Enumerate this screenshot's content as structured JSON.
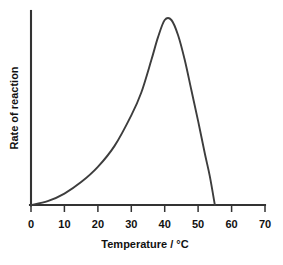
{
  "chart_data": {
    "type": "line",
    "title": "",
    "xlabel": "Temperature / °C",
    "ylabel": "Rate of reaction",
    "xlim": [
      0,
      70
    ],
    "ylim": [
      0,
      1.05
    ],
    "grid": false,
    "legend": "none",
    "x_ticks": [
      "0",
      "10",
      "20",
      "30",
      "40",
      "50",
      "60",
      "70"
    ],
    "x_tick_values": [
      0,
      10,
      20,
      30,
      40,
      50,
      60,
      70
    ],
    "y_ticks": [],
    "series": [
      {
        "name": "Rate of reaction",
        "x": [
          0,
          5,
          10,
          15,
          20,
          25,
          30,
          33,
          36,
          38,
          40,
          42,
          44,
          46,
          48,
          50,
          52,
          53.5,
          55
        ],
        "y": [
          0.0,
          0.02,
          0.06,
          0.12,
          0.2,
          0.31,
          0.47,
          0.59,
          0.76,
          0.88,
          0.97,
          0.97,
          0.89,
          0.76,
          0.6,
          0.44,
          0.27,
          0.15,
          0.0
        ]
      }
    ],
    "annotations": {
      "optimum_temperature": 40,
      "denaturation_end": 55
    },
    "colors": {
      "curve": "#3d3d3d",
      "axis": "#333333",
      "text": "#111111",
      "background": "#ffffff"
    }
  },
  "labels": {
    "x_axis_title": "Temperature / °C",
    "y_axis_title": "Rate of reaction",
    "tick_0": "0",
    "tick_10": "10",
    "tick_20": "20",
    "tick_30": "30",
    "tick_40": "40",
    "tick_50": "50",
    "tick_60": "60",
    "tick_70": "70"
  }
}
